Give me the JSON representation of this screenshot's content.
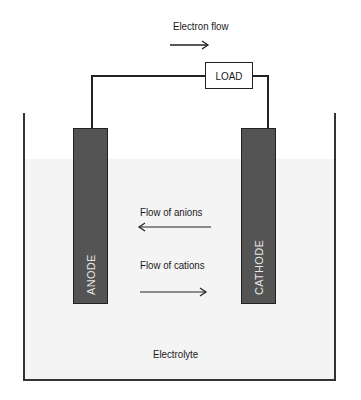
{
  "diagram": {
    "title_arrow_label": "Electron flow",
    "load_label": "LOAD",
    "anode_label": "ANODE",
    "cathode_label": "CATHODE",
    "anion_label": "Flow of anions",
    "cation_label": "Flow of cations",
    "electrolyte_label": "Electrolyte",
    "colors": {
      "electrode_fill": "#545454",
      "electrode_text": "#e6e6e6",
      "electrolyte_fill": "#f4f4f4",
      "lines": "#222222"
    },
    "arrows": {
      "electron_flow": "right",
      "anions": "left",
      "cations": "right"
    }
  }
}
